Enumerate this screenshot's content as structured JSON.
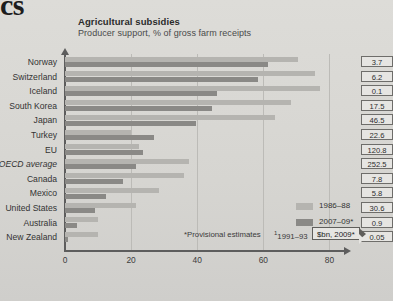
{
  "page": {
    "clipped_heading_fragment": "cs"
  },
  "chart_data": {
    "type": "bar",
    "orientation": "horizontal",
    "title": "Agricultural subsidies",
    "subtitle": "Producer support, % of gross farm receipts",
    "xlabel": "",
    "ylabel": "",
    "xlim": [
      0,
      85
    ],
    "xticks": [
      "0",
      "20",
      "40",
      "60",
      "80"
    ],
    "xtick_values": [
      0,
      20,
      40,
      60,
      80
    ],
    "grid": true,
    "legend_position": "inside-bottom-right",
    "categories": [
      "Norway",
      "Switzerland",
      "Iceland",
      "South Korea",
      "Japan",
      "Turkey",
      "EU",
      "OECD average",
      "Canada",
      "Mexico",
      "United States",
      "Australia",
      "New Zealand"
    ],
    "category_styles": [
      "normal",
      "normal",
      "normal",
      "normal",
      "normal",
      "normal",
      "normal",
      "italic",
      "normal",
      "normal",
      "normal",
      "normal",
      "normal"
    ],
    "series": [
      {
        "name": "1986–88",
        "color": "#b5b4b0",
        "values": [
          70.5,
          75.5,
          77.0,
          68.5,
          63.5,
          20.0,
          22.5,
          37.5,
          36.0,
          28.5,
          21.5,
          10.0,
          10.0
        ]
      },
      {
        "name": "2007–09*",
        "color": "#8a8986",
        "values": [
          61.5,
          58.5,
          46.0,
          44.5,
          39.5,
          27.0,
          23.5,
          21.5,
          17.5,
          12.5,
          9.0,
          3.5,
          0.8
        ]
      }
    ],
    "value_column": {
      "header_callout": "$bn, 2009*",
      "values": [
        "3.7",
        "6.2",
        "0.1",
        "17.5",
        "46.5",
        "22.6",
        "120.8",
        "252.5",
        "7.8",
        "5.8",
        "30.6",
        "0.9",
        "0.05"
      ]
    },
    "legend": [
      {
        "label": "1986–88",
        "color": "#b5b4b0"
      },
      {
        "label": "2007–09*",
        "color": "#8a8986"
      }
    ],
    "annotations": [
      "*Provisional estimates",
      "†1991–93"
    ],
    "footnotes": {
      "provisional": "*Provisional estimates",
      "dagger_marker": "1",
      "dagger_text": "1991–93"
    },
    "colors": {
      "series_light": "#b5b4b0",
      "series_dark": "#8a8986",
      "axis": "#5d5d5d",
      "gridline": "#bcbbb7",
      "background": "#d9d8d4"
    }
  }
}
